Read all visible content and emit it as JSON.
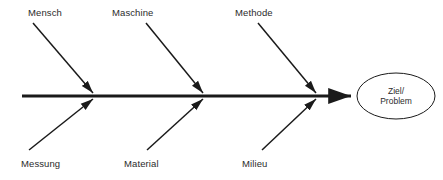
{
  "diagram": {
    "type": "fishbone-ishikawa",
    "language": "de",
    "background_color": "#ffffff",
    "line_color": "#1a1a1a",
    "text_color": "#2b2b2b",
    "spine": {
      "name": "main-spine-arrow",
      "x_start": 22,
      "x_end": 357,
      "y": 96,
      "stroke_width": 3,
      "arrowhead": "right"
    },
    "effect": {
      "name": "effect-node",
      "shape": "ellipse",
      "cx": 396,
      "cy": 96,
      "rx": 39,
      "ry": 23,
      "stroke_width": 1,
      "line1": "Ziel/",
      "line2": "Problem"
    },
    "categories_top": [
      {
        "label": "Mensch",
        "label_x": 28,
        "label_y": 7,
        "bone_x1": 33,
        "bone_y1": 23,
        "bone_x2": 93,
        "bone_y2": 93
      },
      {
        "label": "Maschine",
        "label_x": 112,
        "label_y": 7,
        "bone_x1": 146,
        "bone_y1": 23,
        "bone_x2": 203,
        "bone_y2": 93
      },
      {
        "label": "Methode",
        "label_x": 235,
        "label_y": 7,
        "bone_x1": 258,
        "bone_y1": 23,
        "bone_x2": 316,
        "bone_y2": 93
      }
    ],
    "categories_bottom": [
      {
        "label": "Messung",
        "label_x": 21,
        "label_y": 158,
        "bone_x1": 29,
        "bone_y1": 150,
        "bone_x2": 93,
        "bone_y2": 99
      },
      {
        "label": "Material",
        "label_x": 124,
        "label_y": 158,
        "bone_x1": 147,
        "bone_y1": 150,
        "bone_x2": 203,
        "bone_y2": 99
      },
      {
        "label": "Milieu",
        "label_x": 242,
        "label_y": 158,
        "bone_x1": 262,
        "bone_y1": 150,
        "bone_x2": 316,
        "bone_y2": 99
      }
    ]
  }
}
